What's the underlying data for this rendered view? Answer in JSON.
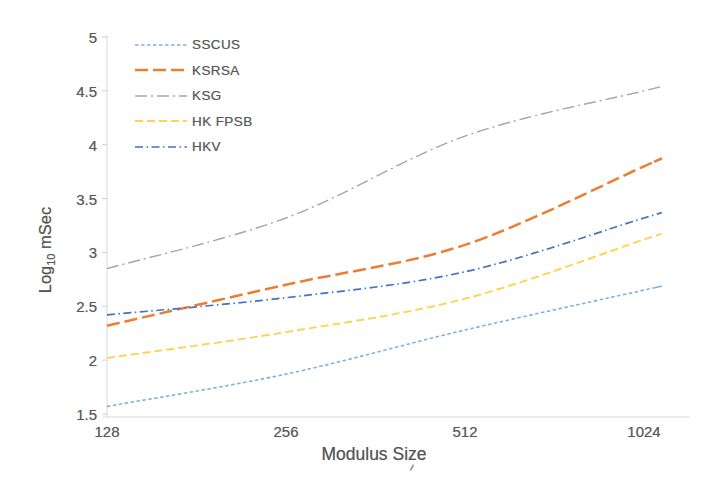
{
  "figure": {
    "x_axis": {
      "title": "Modulus Size",
      "ticks": [
        "128",
        "256",
        "512",
        "1024"
      ]
    },
    "y_axis": {
      "title_prefix": "Log",
      "title_subscript": "10",
      "title_suffix": " mSec",
      "ticks": [
        "1.5",
        "2",
        "2.5",
        "3",
        "3.5",
        "4",
        "4.5",
        "5"
      ]
    },
    "colors": {
      "axis_line": "#d9d9d9",
      "tick_mark": "#cfcfcf",
      "text": "#595959"
    }
  },
  "chart_data": {
    "type": "line",
    "x": [
      128,
      256,
      512,
      1024
    ],
    "x_scale": "log2",
    "categories": [
      "128",
      "256",
      "512",
      "1024"
    ],
    "series": [
      {
        "name": "SSCUS",
        "values": [
          1.57,
          1.87,
          2.28,
          2.65
        ],
        "color": "#7fb2e0",
        "dash": "3.5 2.5",
        "width": 1.6
      },
      {
        "name": "KSRSA",
        "values": [
          2.32,
          2.7,
          3.07,
          3.8
        ],
        "color": "#ed7d31",
        "dash": "13 5",
        "width": 2.5
      },
      {
        "name": "KSG",
        "values": [
          2.85,
          3.32,
          4.08,
          4.5
        ],
        "color": "#a6a6a6",
        "dash": "12 4 2 4",
        "width": 1.4
      },
      {
        "name": "HK FPSB",
        "values": [
          2.02,
          2.26,
          2.57,
          3.12
        ],
        "color": "#ffd24f",
        "dash": "8 4",
        "width": 1.9
      },
      {
        "name": "HKV",
        "values": [
          2.42,
          2.58,
          2.82,
          3.32
        ],
        "color": "#4472c4",
        "dash": "8 3.5 1.5 3.5",
        "width": 1.7
      }
    ],
    "title": "",
    "xlabel": "Modulus Size",
    "ylabel": "Log10 mSec",
    "ylim": [
      1.5,
      5
    ],
    "yticks": [
      1.5,
      2,
      2.5,
      3,
      3.5,
      4,
      4.5,
      5
    ],
    "grid": false,
    "legend_position": "upper-left",
    "line_style": "smooth-dashed"
  }
}
